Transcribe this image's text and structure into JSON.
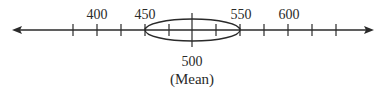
{
  "diagram": {
    "type": "number-line",
    "axis": {
      "y": 30,
      "x_start": 14,
      "x_end": 372,
      "color": "#2a2a2a"
    },
    "ticks": [
      {
        "x": 73,
        "value": 375
      },
      {
        "x": 97,
        "value": 400,
        "label": "400"
      },
      {
        "x": 121,
        "value": 425
      },
      {
        "x": 145,
        "value": 450,
        "label": "450"
      },
      {
        "x": 169,
        "value": 475
      },
      {
        "x": 192,
        "value": 500,
        "center": true
      },
      {
        "x": 216,
        "value": 525
      },
      {
        "x": 240,
        "value": 550,
        "label": "550"
      },
      {
        "x": 264,
        "value": 575
      },
      {
        "x": 288,
        "value": 600,
        "label": "600"
      },
      {
        "x": 312,
        "value": 625
      },
      {
        "x": 336,
        "value": 650
      }
    ],
    "labels": {
      "l400": "400",
      "l450": "450",
      "l550": "550",
      "l600": "600",
      "center_value": "500",
      "center_caption": "(Mean)"
    },
    "ellipse": {
      "cx": 192,
      "cy": 30,
      "rx": 48,
      "ry": 11,
      "from": 450,
      "to": 550
    }
  }
}
